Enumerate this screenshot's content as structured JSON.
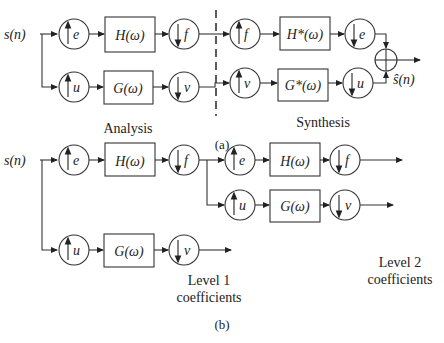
{
  "panel_a": {
    "caption": "(a)",
    "input_label": "s(n)",
    "output_label": "ŝ(n)",
    "analysis_label": "Analysis",
    "synthesis_label": "Synthesis",
    "analysis_top": {
      "up": "e",
      "filter": "H(ω)",
      "down": "f"
    },
    "analysis_bottom": {
      "up": "u",
      "filter": "G(ω)",
      "down": "v"
    },
    "synthesis_top": {
      "up": "f",
      "filter": "H*(ω)",
      "down": "e"
    },
    "synthesis_bottom": {
      "up": "v",
      "filter": "G*(ω)",
      "down": "u"
    }
  },
  "panel_b": {
    "caption": "(b)",
    "input_label": "s(n)",
    "level1_top": {
      "up": "e",
      "filter": "H(ω)",
      "down": "f"
    },
    "level1_bottom": {
      "up": "u",
      "filter": "G(ω)",
      "down": "v"
    },
    "level2_top": {
      "up": "e",
      "filter": "H(ω)",
      "down": "f"
    },
    "level2_bottom": {
      "up": "u",
      "filter": "G(ω)",
      "down": "v"
    },
    "level1_label": [
      "Level 1",
      "coefficients"
    ],
    "level2_label": [
      "Level 2",
      "coefficients"
    ]
  }
}
